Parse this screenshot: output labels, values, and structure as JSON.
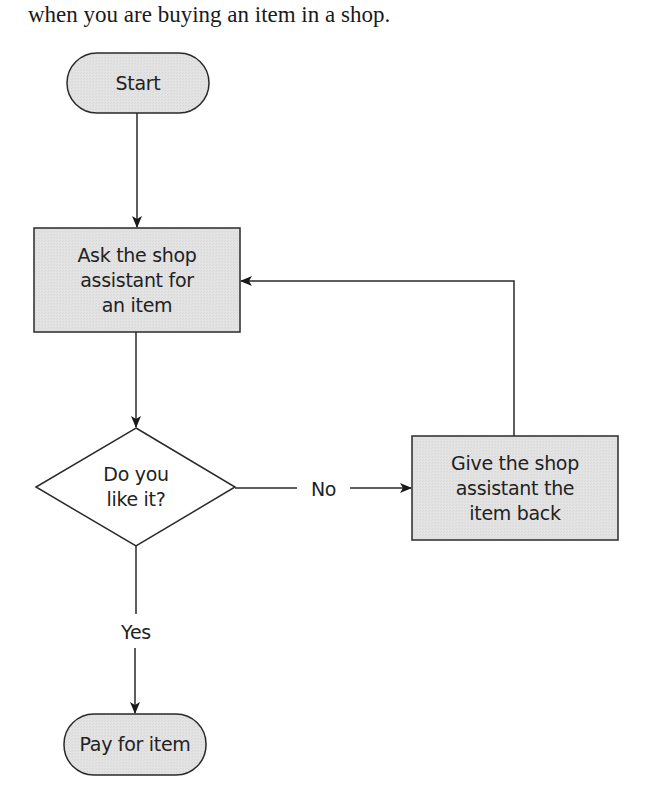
{
  "intro_text": "when you are buying an item in a shop.",
  "colors": {
    "node_fill": "#e2e2e2",
    "stroke": "#2a2a2a",
    "decision_fill": "#ffffff",
    "background": "#ffffff"
  },
  "flowchart": {
    "nodes": [
      {
        "id": "start",
        "type": "terminator",
        "label": "Start"
      },
      {
        "id": "ask",
        "type": "process",
        "label": "Ask the shop\nassistant for\nan item"
      },
      {
        "id": "like",
        "type": "decision",
        "label": "Do you\nlike it?"
      },
      {
        "id": "give_back",
        "type": "process",
        "label": "Give the shop\nassistant the\nitem back"
      },
      {
        "id": "pay",
        "type": "terminator",
        "label": "Pay for item"
      }
    ],
    "edges": [
      {
        "from": "start",
        "to": "ask",
        "label": ""
      },
      {
        "from": "ask",
        "to": "like",
        "label": ""
      },
      {
        "from": "like",
        "to": "give_back",
        "label": "No"
      },
      {
        "from": "give_back",
        "to": "ask",
        "label": ""
      },
      {
        "from": "like",
        "to": "pay",
        "label": "Yes"
      }
    ]
  },
  "labels": {
    "start": "Start",
    "ask_lines": [
      "Ask the shop",
      "assistant for",
      "an item"
    ],
    "like_lines": [
      "Do you",
      "like it?"
    ],
    "give_back_lines": [
      "Give the shop",
      "assistant the",
      "item back"
    ],
    "pay": "Pay for item",
    "edge_no": "No",
    "edge_yes": "Yes"
  }
}
